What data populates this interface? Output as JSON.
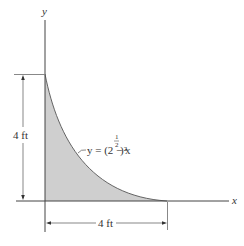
{
  "diagram": {
    "axes": {
      "x_label": "x",
      "y_label": "y"
    },
    "curve": {
      "equation_prefix": "y = (2 − x",
      "exponent_num": "1",
      "exponent_den": "2",
      "equation_suffix": ")²"
    },
    "dimensions": {
      "vertical": "4 ft",
      "horizontal": "4 ft"
    },
    "colors": {
      "fill": "#cfcfcf",
      "line": "#555555"
    }
  }
}
